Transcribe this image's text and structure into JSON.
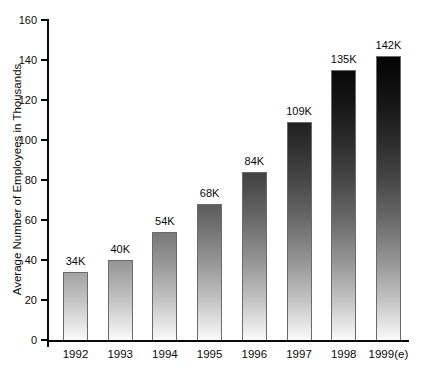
{
  "chart_data": {
    "type": "bar",
    "title": "",
    "xlabel": "",
    "ylabel": "Average Number of Employees in Thousands",
    "categories": [
      "1992",
      "1993",
      "1994",
      "1995",
      "1996",
      "1997",
      "1998",
      "1999(e)"
    ],
    "values": [
      34,
      40,
      54,
      68,
      84,
      109,
      135,
      142
    ],
    "bar_labels": [
      "34K",
      "40K",
      "54K",
      "68K",
      "84K",
      "109K",
      "135K",
      "142K"
    ],
    "ylim": [
      0,
      160
    ],
    "yticks": [
      0,
      20,
      40,
      60,
      80,
      100,
      120,
      140,
      160
    ],
    "grid": false,
    "legend": null,
    "style": {
      "bar_fill_bottom": "#fafafa",
      "bar_fill_top": "#000000",
      "bar_outline": "#6b6b6b",
      "axis_color": "#0a0a0a",
      "background": "#ffffff"
    }
  }
}
